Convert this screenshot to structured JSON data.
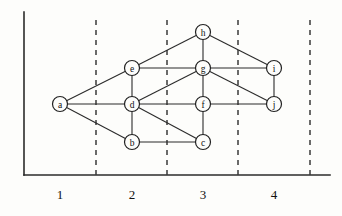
{
  "figure": {
    "title": "",
    "background_color": "#fdfdfb",
    "axis_color": "#2b2b2b",
    "edge_color": "#2b2b2b",
    "node_fill": "#fdfdfb",
    "node_stroke": "#222222",
    "dashed_color": "#3a3a3a"
  },
  "axes": {
    "origin_x": 24,
    "origin_y": 175,
    "top_y": 12,
    "right_x": 330,
    "x_tick_labels": [
      "1",
      "2",
      "3",
      "4"
    ],
    "x_tick_label_positions": [
      60,
      132,
      203,
      274
    ],
    "x_tick_label_y": 199
  },
  "separators": {
    "label": "layer-boundaries",
    "x_positions": [
      96,
      167,
      238,
      310
    ],
    "y_top": 20,
    "y_bottom": 175
  },
  "chart_data": {
    "type": "diagram",
    "subtype": "layered-graph",
    "title": "",
    "xlabel": "",
    "ylabel": "",
    "grid": "vertical-dashed-layer-separators",
    "legend": "none",
    "xlim": [
      24,
      330
    ],
    "ylim": [
      12,
      175
    ],
    "node_radius": 7.5,
    "nodes": [
      {
        "id": "a",
        "label": "a",
        "x": 60,
        "y": 104,
        "layer": 1
      },
      {
        "id": "b",
        "label": "b",
        "x": 132,
        "y": 142,
        "layer": 2
      },
      {
        "id": "d",
        "label": "d",
        "x": 132,
        "y": 104,
        "layer": 2
      },
      {
        "id": "e",
        "label": "e",
        "x": 132,
        "y": 68,
        "layer": 2
      },
      {
        "id": "c",
        "label": "c",
        "x": 203,
        "y": 142,
        "layer": 3
      },
      {
        "id": "f",
        "label": "f",
        "x": 203,
        "y": 104,
        "layer": 3
      },
      {
        "id": "g",
        "label": "g",
        "x": 203,
        "y": 68,
        "layer": 3
      },
      {
        "id": "h",
        "label": "h",
        "x": 203,
        "y": 32,
        "layer": 3
      },
      {
        "id": "i",
        "label": "i",
        "x": 274,
        "y": 68,
        "layer": 4
      },
      {
        "id": "j",
        "label": "j",
        "x": 274,
        "y": 104,
        "layer": 4
      }
    ],
    "edges": [
      {
        "from": "a",
        "to": "e"
      },
      {
        "from": "a",
        "to": "d"
      },
      {
        "from": "a",
        "to": "b"
      },
      {
        "from": "e",
        "to": "d"
      },
      {
        "from": "e",
        "to": "g"
      },
      {
        "from": "e",
        "to": "h"
      },
      {
        "from": "d",
        "to": "b"
      },
      {
        "from": "d",
        "to": "f"
      },
      {
        "from": "d",
        "to": "g"
      },
      {
        "from": "d",
        "to": "c"
      },
      {
        "from": "b",
        "to": "c"
      },
      {
        "from": "c",
        "to": "f"
      },
      {
        "from": "f",
        "to": "g"
      },
      {
        "from": "f",
        "to": "j"
      },
      {
        "from": "g",
        "to": "h"
      },
      {
        "from": "g",
        "to": "i"
      },
      {
        "from": "g",
        "to": "j"
      },
      {
        "from": "h",
        "to": "i"
      },
      {
        "from": "i",
        "to": "j"
      }
    ]
  }
}
